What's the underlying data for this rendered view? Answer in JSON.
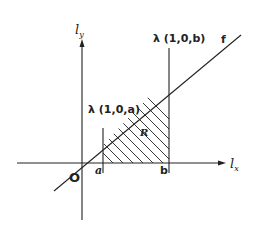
{
  "diagram": {
    "axes": {
      "y_label": "l",
      "y_sub": "y",
      "x_label": "l",
      "x_sub": "x",
      "origin_label": "O"
    },
    "line_label": "f",
    "lambda_a_label": "λ (1,0,a)",
    "lambda_b_label": "λ (1,0,b)",
    "tick_a": "a",
    "tick_b": "b",
    "region_label": "R",
    "colors": {
      "ink": "#222222",
      "background": "#ffffff"
    }
  }
}
